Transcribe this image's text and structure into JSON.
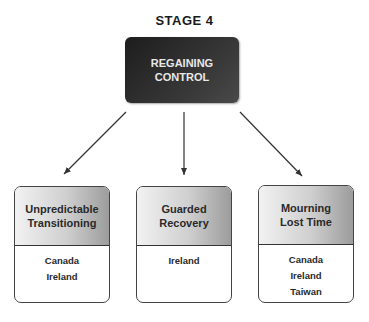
{
  "stage_label": "STAGE 4",
  "root": {
    "lines": [
      "REGAINING",
      "CONTROL"
    ]
  },
  "branches": [
    {
      "title_lines": [
        "Unpredictable",
        "Transitioning"
      ],
      "countries": [
        "Canada",
        "Ireland"
      ]
    },
    {
      "title_lines": [
        "Guarded",
        "Recovery"
      ],
      "countries": [
        "Ireland"
      ]
    },
    {
      "title_lines": [
        "Mourning",
        "Lost Time"
      ],
      "countries": [
        "Canada",
        "Ireland",
        "Taiwan"
      ]
    }
  ]
}
